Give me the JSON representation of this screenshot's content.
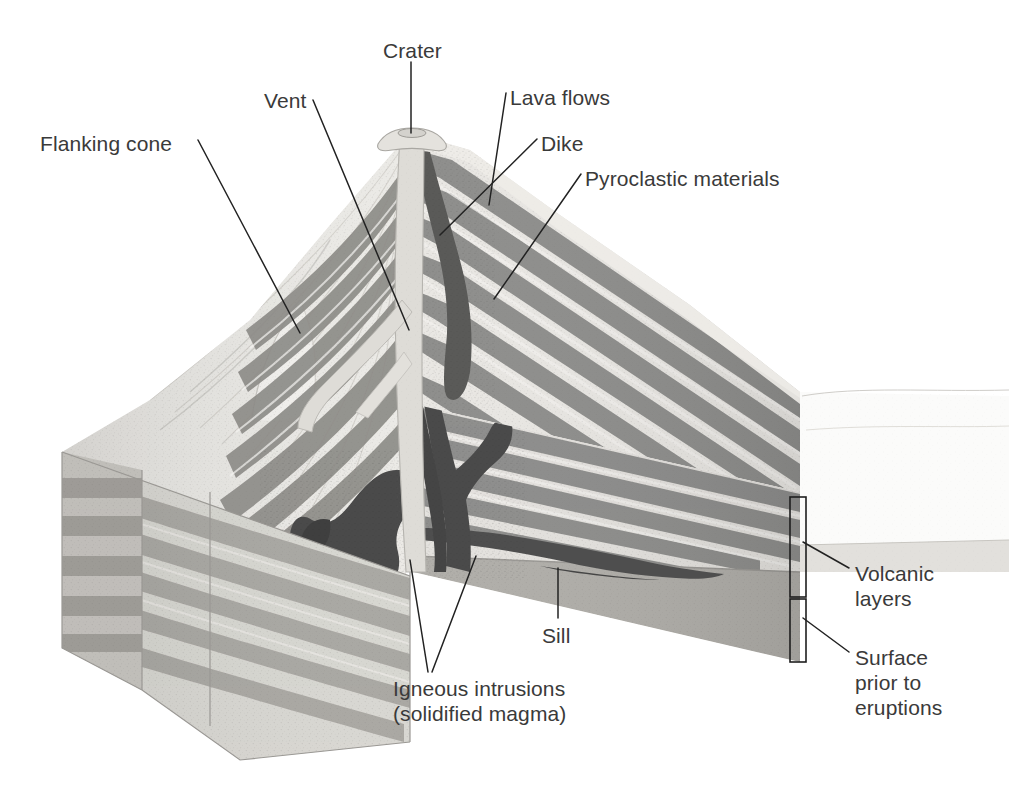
{
  "figure": {
    "background_color": "#ffffff",
    "label_color": "#3a3a3a",
    "leader_color": "#222222"
  },
  "palette": {
    "pyroclastic_light": "#e9e7e3",
    "lava_gray": "#8e8e8c",
    "lava_gray_dark": "#787874",
    "intrusion_dark": "#4a4a4a",
    "vent_light": "#dedcd7",
    "basement_gray": "#a9a7a3",
    "basement_gray_dark": "#9a9894",
    "sediment_light": "#d8d6d1",
    "sediment_mid": "#b4b2ad",
    "horizon_faint": "#f0efec",
    "outline": "#8a8884"
  },
  "labels": [
    {
      "id": "crater",
      "text": "Crater",
      "x": 383,
      "y": 38,
      "align": "left"
    },
    {
      "id": "vent",
      "text": "Vent",
      "x": 264,
      "y": 88,
      "align": "left"
    },
    {
      "id": "lava-flows",
      "text": "Lava flows",
      "x": 510,
      "y": 85,
      "align": "left"
    },
    {
      "id": "flanking-cone",
      "text": "Flanking cone",
      "x": 40,
      "y": 131,
      "align": "left"
    },
    {
      "id": "dike",
      "text": "Dike",
      "x": 541,
      "y": 131,
      "align": "left"
    },
    {
      "id": "pyroclastic",
      "text": "Pyroclastic materials",
      "x": 585,
      "y": 166,
      "align": "left"
    },
    {
      "id": "volcanic-layers",
      "text": "Volcanic\nlayers",
      "x": 855,
      "y": 561,
      "align": "left"
    },
    {
      "id": "sill",
      "text": "Sill",
      "x": 542,
      "y": 623,
      "align": "left"
    },
    {
      "id": "surface-prior",
      "text": "Surface\nprior to\neruptions",
      "x": 855,
      "y": 645,
      "align": "left"
    },
    {
      "id": "igneous-intrusions",
      "text": "Igneous intrusions\n(solidified magma)",
      "x": 393,
      "y": 676,
      "align": "left"
    }
  ],
  "leader_lines": [
    {
      "id": "crater-leader",
      "points": "411,62 411,133"
    },
    {
      "id": "vent-leader",
      "points": "313,100 409,330"
    },
    {
      "id": "lava-flows-leader",
      "points": "506,93 489,205"
    },
    {
      "id": "flanking-cone-leader",
      "points": "198,140 300,333"
    },
    {
      "id": "dike-leader",
      "points": "537,139 440,235"
    },
    {
      "id": "pyroclastic-leader",
      "points": "581,174 494,299"
    },
    {
      "id": "sill-leader",
      "points": "558,618 558,568"
    },
    {
      "id": "igneous-leader-a",
      "points": "428,672 410,560"
    },
    {
      "id": "igneous-leader-b",
      "points": "432,672 476,556"
    },
    {
      "id": "volcanic-layers-leader",
      "points": "849,568 803,542"
    },
    {
      "id": "surface-prior-leader",
      "points": "849,652 803,618"
    }
  ],
  "brackets": [
    {
      "id": "volcanic-layers-bracket",
      "x": 790,
      "y": 497,
      "width": 16,
      "height": 100
    },
    {
      "id": "surface-prior-bracket",
      "x": 790,
      "y": 599,
      "width": 16,
      "height": 63
    }
  ],
  "features": {
    "crater_summit": {
      "x": 411,
      "y": 132
    },
    "vent_conduit": "vertical light magma conduit from crater to base",
    "flanking_cone_branch": "secondary conduit branching left from main vent",
    "dike": "dark near-vertical intrusion cutting layers on right flank",
    "sill": "dark horizontal intrusion along bedding plane on right face",
    "layer_count_right_face": 11,
    "layer_count_left_face": 9
  }
}
